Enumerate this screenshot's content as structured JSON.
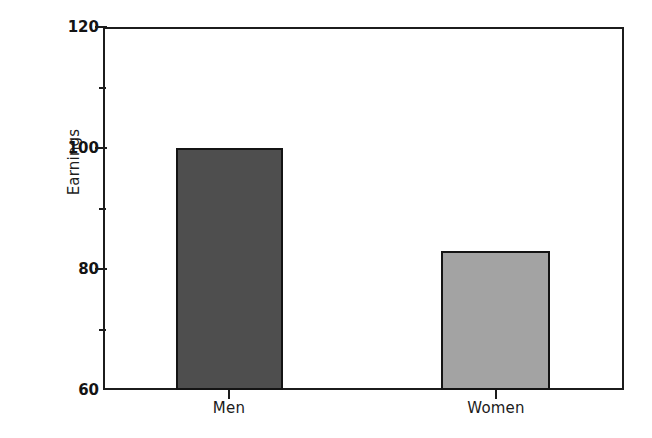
{
  "chart_data": {
    "type": "bar",
    "title": "",
    "subtitle": "",
    "xlabel": "",
    "ylabel": "Earnings",
    "categories": [
      "Men",
      "Women"
    ],
    "values": [
      100,
      83
    ],
    "series": [
      {
        "name": "Earnings",
        "values": [
          100,
          83
        ]
      }
    ],
    "ylim": [
      60,
      120
    ],
    "y_major_ticks": [
      60,
      80,
      100,
      120
    ],
    "y_major_tick_labels": [
      "60",
      "80",
      "100",
      "120"
    ],
    "y_minor_ticks": [
      70,
      90,
      110
    ],
    "grid": false,
    "legend": null,
    "legend_position": "none",
    "annotations": [],
    "bar_colors": [
      "#4e4e4e",
      "#a3a3a3"
    ],
    "bar_edge_color": "#141414",
    "axis_color": "#1c1c1c",
    "background_color": "#ffffff"
  },
  "axes": {
    "y_title": "Earnings",
    "y_labels": {
      "t120": "120",
      "t100": "100",
      "t80": "80",
      "t60": "60"
    },
    "x_labels": {
      "men": "Men",
      "women": "Women"
    }
  }
}
